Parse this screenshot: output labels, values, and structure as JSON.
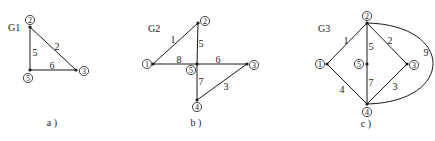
{
  "graphs": [
    {
      "id": "G1",
      "title": "G1",
      "caption": "a )",
      "title_pos": [
        8,
        31
      ],
      "caption_pos": [
        52,
        126
      ],
      "nodes": [
        {
          "label": "②",
          "x": 30,
          "y": 27,
          "lx": 30,
          "ly": 20
        },
        {
          "label": "⑤",
          "x": 30,
          "y": 70,
          "lx": 28,
          "ly": 78
        },
        {
          "label": "③",
          "x": 76,
          "y": 70,
          "lx": 84,
          "ly": 71
        }
      ],
      "edges": [
        {
          "label": "5",
          "from": [
            30,
            27
          ],
          "to": [
            30,
            70
          ],
          "lx": 35,
          "ly": 52
        },
        {
          "label": "2",
          "from": [
            30,
            27
          ],
          "to": [
            76,
            70
          ],
          "lx": 57,
          "ly": 46
        },
        {
          "label": "6",
          "from": [
            30,
            70
          ],
          "to": [
            76,
            70
          ],
          "lx": 52,
          "ly": 65
        }
      ]
    },
    {
      "id": "G2",
      "title": "G2",
      "caption": "b )",
      "title_pos": [
        148,
        32
      ],
      "caption_pos": [
        196,
        126
      ],
      "nodes": [
        {
          "label": "②",
          "x": 198,
          "y": 23,
          "lx": 205,
          "ly": 21
        },
        {
          "label": "①",
          "x": 153,
          "y": 64,
          "lx": 147,
          "ly": 64
        },
        {
          "label": "⑤",
          "x": 197,
          "y": 64,
          "lx": 191,
          "ly": 70
        },
        {
          "label": "③",
          "x": 247,
          "y": 64,
          "lx": 254,
          "ly": 65
        },
        {
          "label": "④",
          "x": 197,
          "y": 100,
          "lx": 197,
          "ly": 107
        }
      ],
      "edges": [
        {
          "label": "1",
          "from": [
            153,
            64
          ],
          "to": [
            198,
            23
          ],
          "lx": 173,
          "ly": 39
        },
        {
          "label": "5",
          "from": [
            198,
            23
          ],
          "to": [
            197,
            64
          ],
          "lx": 201,
          "ly": 43
        },
        {
          "label": "8",
          "from": [
            153,
            64
          ],
          "to": [
            197,
            64
          ],
          "lx": 179,
          "ly": 59
        },
        {
          "label": "6",
          "from": [
            197,
            64
          ],
          "to": [
            247,
            64
          ],
          "lx": 218,
          "ly": 59
        },
        {
          "label": "7",
          "from": [
            197,
            64
          ],
          "to": [
            197,
            100
          ],
          "lx": 201,
          "ly": 81
        },
        {
          "label": "3",
          "from": [
            247,
            64
          ],
          "to": [
            197,
            100
          ],
          "lx": 226,
          "ly": 86
        }
      ]
    },
    {
      "id": "G3",
      "title": "G3",
      "caption": "c )",
      "title_pos": [
        318,
        32
      ],
      "caption_pos": [
        366,
        127
      ],
      "nodes": [
        {
          "label": "②",
          "x": 367,
          "y": 23,
          "lx": 367,
          "ly": 16
        },
        {
          "label": "①",
          "x": 327,
          "y": 64,
          "lx": 320,
          "ly": 64
        },
        {
          "label": "⑤",
          "x": 367,
          "y": 64,
          "lx": 359,
          "ly": 64
        },
        {
          "label": "③",
          "x": 407,
          "y": 64,
          "lx": 414,
          "ly": 65
        },
        {
          "label": "④",
          "x": 367,
          "y": 104,
          "lx": 367,
          "ly": 112
        }
      ],
      "edges": [
        {
          "label": "1",
          "from": [
            327,
            64
          ],
          "to": [
            367,
            23
          ],
          "lx": 346,
          "ly": 40
        },
        {
          "label": "2",
          "from": [
            367,
            23
          ],
          "to": [
            407,
            64
          ],
          "lx": 390,
          "ly": 40
        },
        {
          "label": "5",
          "from": [
            367,
            23
          ],
          "to": [
            367,
            64
          ],
          "lx": 371,
          "ly": 46
        },
        {
          "label": "7",
          "from": [
            367,
            64
          ],
          "to": [
            367,
            104
          ],
          "lx": 371,
          "ly": 82
        },
        {
          "label": "4",
          "from": [
            327,
            64
          ],
          "to": [
            367,
            104
          ],
          "lx": 342,
          "ly": 89
        },
        {
          "label": "3",
          "from": [
            407,
            64
          ],
          "to": [
            367,
            104
          ],
          "lx": 395,
          "ly": 86
        },
        {
          "label": "9",
          "curve": "M367,23 C455,25 455,102 367,104",
          "lx": 426,
          "ly": 52
        }
      ]
    }
  ]
}
